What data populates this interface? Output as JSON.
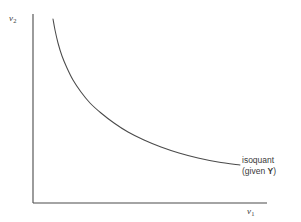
{
  "figure": {
    "background_color": "#ffffff",
    "line_color": "#4a4a4a",
    "text_color": "#3a3a3a"
  },
  "axes": {
    "y_label_main": "v",
    "y_label_sub": "2",
    "x_label_main": "v",
    "x_label_sub": "1"
  },
  "annotation": {
    "line1": "isoquant",
    "line2_prefix": "(given ",
    "line2_symbol": "Y",
    "line2_suffix": ")"
  },
  "chart_data": {
    "type": "line",
    "title": "",
    "xlabel": "v1",
    "ylabel": "v2",
    "grid": false,
    "legend": "none",
    "axis_origin_px": [
      33,
      203
    ],
    "x_axis_end_px": [
      267,
      203
    ],
    "y_axis_end_px": [
      33,
      14
    ],
    "annotations": [
      {
        "text": "isoquant (given Y)",
        "attached_to": "isoquant-curve",
        "position_px": [
          242,
          155
        ]
      }
    ],
    "series": [
      {
        "name": "isoquant",
        "description": "Convex-to-origin isoquant curve, constant output Y, decreasing marginal rate of technical substitution",
        "points_px": [
          [
            53,
            19
          ],
          [
            55,
            30
          ],
          [
            58,
            43
          ],
          [
            62,
            56
          ],
          [
            67,
            68
          ],
          [
            73,
            80
          ],
          [
            81,
            92
          ],
          [
            90,
            103
          ],
          [
            101,
            113
          ],
          [
            114,
            123
          ],
          [
            128,
            132
          ],
          [
            144,
            140
          ],
          [
            161,
            147
          ],
          [
            179,
            153
          ],
          [
            198,
            158
          ],
          [
            218,
            162
          ],
          [
            240,
            165
          ]
        ]
      }
    ]
  }
}
